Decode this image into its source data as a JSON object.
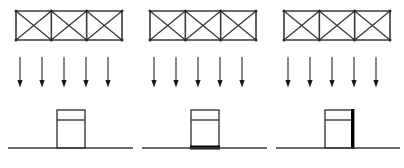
{
  "figure": {
    "background_color": "#ffffff",
    "line_color": "#3a3a3a",
    "highlight_color": "#000000",
    "width": 404,
    "height": 168
  },
  "common": {
    "truss": {
      "bays": 3,
      "bracing": "X",
      "width": 106,
      "height": 29,
      "top_y": 11,
      "bottom_y": 40,
      "node_marker": "joint-dot"
    },
    "load_arrows": {
      "count": 5,
      "direction": "down",
      "top_y": 57,
      "tip_y": 87,
      "spacing": 22,
      "head_style": "solid-triangle",
      "label": "uniform gravity load"
    },
    "column": {
      "width": 28,
      "top_y": 110,
      "base_y": 148,
      "capital_line_y": 120,
      "label": "pier / column"
    },
    "ground": {
      "y": 148,
      "label": "ground line"
    }
  },
  "panels": [
    {
      "id": "panel-a",
      "name": "undamaged",
      "order": 1,
      "origin_x": 8,
      "truss_x": 16,
      "arrows_x_start": 20,
      "column_x": 57,
      "ground_x_start": 8,
      "ground_x_end": 133,
      "highlight": "none",
      "highlight_description": "no plastic hinge highlighted"
    },
    {
      "id": "panel-b",
      "name": "base-hinge",
      "order": 2,
      "origin_x": 142,
      "truss_x": 150,
      "arrows_x_start": 154,
      "column_x": 191,
      "ground_x_start": 142,
      "ground_x_end": 267,
      "highlight": "base",
      "highlight_description": "thick black plastic hinge at column base"
    },
    {
      "id": "panel-c",
      "name": "side-hinge",
      "order": 3,
      "origin_x": 276,
      "truss_x": 284,
      "arrows_x_start": 288,
      "column_x": 325,
      "ground_x_start": 276,
      "ground_x_end": 400,
      "highlight": "right-edge",
      "highlight_description": "thick black yielding along right face of column"
    }
  ]
}
